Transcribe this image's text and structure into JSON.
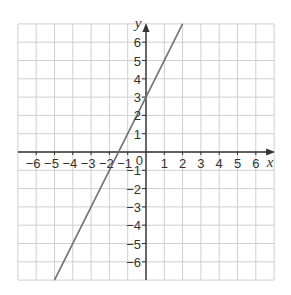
{
  "chart_data": {
    "type": "line",
    "title": "",
    "xlabel": "x",
    "ylabel": "y",
    "xlim": [
      -7,
      7
    ],
    "ylim": [
      -7,
      7
    ],
    "grid": true,
    "x_ticks": [
      -6,
      -5,
      -4,
      -3,
      -2,
      -1,
      0,
      1,
      2,
      3,
      4,
      5,
      6
    ],
    "y_ticks": [
      -6,
      -5,
      -4,
      -3,
      -2,
      -1,
      1,
      2,
      3,
      4,
      5,
      6
    ],
    "origin_label": "0",
    "series": [
      {
        "name": "y = 2x + 3",
        "equation": "y = 2x + 3",
        "x": [
          -5,
          2
        ],
        "y": [
          -7,
          7
        ]
      }
    ]
  },
  "colors": {
    "grid": "#cfcfcf",
    "axis": "#333333",
    "line": "#707070",
    "text": "#333333"
  }
}
